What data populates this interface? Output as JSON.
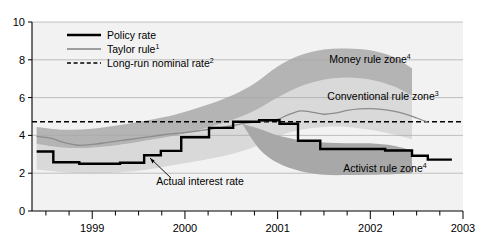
{
  "chart_data": {
    "type": "area",
    "title": "",
    "xlabel": "",
    "ylabel": "",
    "ylim": [
      0,
      10
    ],
    "xlim": [
      1998.35,
      2003.0
    ],
    "grid": true,
    "y_ticks": [
      "0",
      "2",
      "4",
      "6",
      "8",
      "10"
    ],
    "y_tick_values": [
      0,
      2,
      4,
      6,
      8,
      10
    ],
    "x_ticks": [
      "1999",
      "2000",
      "2001",
      "2002",
      "2003"
    ],
    "x_tick_values": [
      1999,
      2000,
      2001,
      2002,
      2003
    ],
    "x_minor_step": 0.25,
    "legend": {
      "position": "top-left-inside",
      "entries": [
        {
          "label": "Policy rate",
          "style": "thick-solid-black",
          "color": "#000000"
        },
        {
          "label": "Taylor rule",
          "sup": "1",
          "style": "thin-solid-gray",
          "color": "#808080"
        },
        {
          "label": "Long-run nominal rate",
          "sup": "2",
          "style": "dashed-black",
          "color": "#000000"
        }
      ]
    },
    "annotations": [
      {
        "name": "money-rule-zone",
        "text": "Money rule zone",
        "sup": "4",
        "x": 370,
        "y": 63
      },
      {
        "name": "conventional-rule-zone",
        "text": "Conventional rule zone",
        "sup": "3",
        "x": 383,
        "y": 100
      },
      {
        "name": "activist-rule-zone",
        "text": "Activist rule zone",
        "sup": "4",
        "x": 385,
        "y": 172
      },
      {
        "name": "actual-interest-rate",
        "text": "Actual interest rate",
        "x": 200,
        "y": 185
      }
    ],
    "series": [
      {
        "name": "Long-run nominal rate",
        "type": "hline",
        "value": 4.72,
        "style": "dashed",
        "color": "#000000"
      },
      {
        "name": "Taylor rule",
        "type": "line",
        "color": "#8c8c8c",
        "x": [
          1998.4,
          1998.55,
          1998.7,
          1998.85,
          1999.0,
          1999.15,
          1999.3,
          1999.45,
          1999.6,
          1999.75,
          1999.9,
          2000.05,
          2000.2,
          2000.35,
          2000.5,
          2000.62,
          2000.75,
          2000.88,
          2001.0,
          2001.12,
          2001.25,
          2001.38,
          2001.5,
          2001.62,
          2001.75,
          2001.88,
          2002.0,
          2002.12,
          2002.25,
          2002.38,
          2002.5,
          2002.62
        ],
        "y": [
          3.95,
          3.85,
          3.62,
          3.48,
          3.52,
          3.62,
          3.72,
          3.82,
          3.92,
          4.02,
          4.1,
          4.18,
          4.28,
          4.38,
          4.5,
          4.62,
          4.7,
          4.78,
          4.85,
          5.1,
          5.3,
          5.22,
          5.12,
          5.18,
          5.32,
          5.4,
          5.42,
          5.38,
          5.28,
          5.12,
          4.92,
          4.7
        ]
      },
      {
        "name": "Policy rate",
        "type": "step",
        "color": "#000000",
        "steps": [
          {
            "x0": 1998.4,
            "x1": 1998.58,
            "y": 3.15
          },
          {
            "x0": 1998.58,
            "x1": 1998.86,
            "y": 2.58
          },
          {
            "x0": 1998.86,
            "x1": 1999.3,
            "y": 2.5
          },
          {
            "x0": 1999.3,
            "x1": 1999.56,
            "y": 2.55
          },
          {
            "x0": 1999.56,
            "x1": 1999.74,
            "y": 2.95
          },
          {
            "x0": 1999.74,
            "x1": 1999.96,
            "y": 3.18
          },
          {
            "x0": 1999.96,
            "x1": 2000.26,
            "y": 3.9
          },
          {
            "x0": 2000.26,
            "x1": 2000.52,
            "y": 4.4
          },
          {
            "x0": 2000.52,
            "x1": 2000.8,
            "y": 4.72
          },
          {
            "x0": 2000.8,
            "x1": 2001.02,
            "y": 4.8
          },
          {
            "x0": 2001.02,
            "x1": 2001.22,
            "y": 4.62
          },
          {
            "x0": 2001.22,
            "x1": 2001.46,
            "y": 3.72
          },
          {
            "x0": 2001.46,
            "x1": 2002.16,
            "y": 3.28
          },
          {
            "x0": 2002.16,
            "x1": 2002.45,
            "y": 3.2
          },
          {
            "x0": 2002.45,
            "x1": 2002.62,
            "y": 2.92
          },
          {
            "x0": 2002.62,
            "x1": 2002.88,
            "y": 2.72
          }
        ]
      },
      {
        "name": "Money rule zone",
        "type": "band",
        "color": "#b4b4b4",
        "x": [
          1998.4,
          1998.7,
          1999.0,
          1999.3,
          1999.6,
          1999.9,
          2000.2,
          2000.5,
          2000.75,
          2001.0,
          2001.25,
          2001.5,
          2001.75,
          2002.0,
          2002.25,
          2002.45
        ],
        "upper": [
          4.45,
          4.3,
          4.35,
          4.55,
          4.8,
          5.1,
          5.55,
          6.1,
          6.75,
          7.65,
          8.25,
          8.55,
          8.6,
          8.5,
          8.15,
          7.55
        ],
        "lower": [
          3.55,
          3.35,
          3.35,
          3.5,
          3.75,
          4.0,
          4.35,
          4.8,
          5.3,
          6.0,
          6.6,
          6.95,
          7.05,
          6.95,
          6.6,
          6.1
        ]
      },
      {
        "name": "Conventional rule zone",
        "type": "band",
        "color": "#d9d9d9",
        "x": [
          1998.4,
          1998.7,
          1999.0,
          1999.3,
          1999.6,
          1999.9,
          2000.2,
          2000.5,
          2000.75,
          2001.0,
          2001.25,
          2001.5,
          2001.75,
          2002.0,
          2002.25,
          2002.45
        ],
        "upper": [
          3.55,
          3.35,
          3.35,
          3.5,
          3.75,
          4.0,
          4.35,
          4.8,
          5.3,
          6.0,
          6.6,
          6.95,
          7.05,
          6.95,
          6.6,
          6.1
        ],
        "lower": [
          2.2,
          2.05,
          2.0,
          2.05,
          2.2,
          2.45,
          2.7,
          3.0,
          3.4,
          3.95,
          4.3,
          4.45,
          4.45,
          4.3,
          4.05,
          3.8
        ]
      },
      {
        "name": "Activist rule zone",
        "type": "band",
        "color": "#a8a8a8",
        "x": [
          2000.62,
          2000.8,
          2001.0,
          2001.25,
          2001.5,
          2001.75,
          2002.0,
          2002.25,
          2002.45
        ],
        "upper": [
          4.6,
          4.35,
          4.0,
          3.75,
          3.62,
          3.58,
          3.58,
          3.45,
          3.2
        ],
        "lower": [
          4.6,
          3.3,
          2.55,
          2.1,
          1.92,
          1.9,
          1.92,
          1.95,
          2.0
        ]
      }
    ]
  }
}
